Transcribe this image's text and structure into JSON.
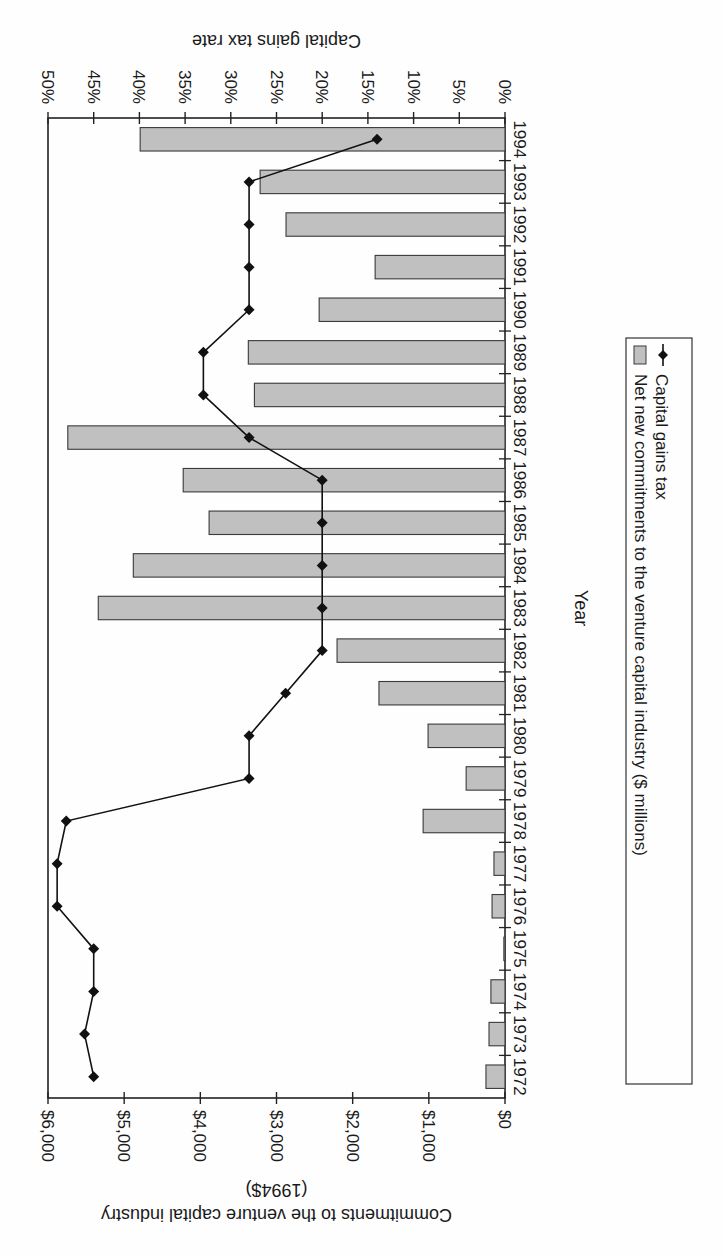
{
  "chart_data": {
    "type": "bar",
    "orientation": "horizontal",
    "rendered_rotation_deg": 180,
    "title": "",
    "categories": [
      "1972",
      "1973",
      "1974",
      "1975",
      "1976",
      "1977",
      "1978",
      "1979",
      "1980",
      "1981",
      "1982",
      "1983",
      "1984",
      "1985",
      "1986",
      "1987",
      "1988",
      "1989",
      "1990",
      "1991",
      "1992",
      "1993",
      "1994"
    ],
    "category_axis_label": "Year",
    "series": [
      {
        "name": "Net new commitments to the venture capital industry ($ millions)",
        "type": "bar",
        "axis": "primary",
        "color": "#c0c0c0",
        "values": [
          250,
          210,
          185,
          15,
          170,
          145,
          1075,
          510,
          1010,
          1655,
          2205,
          5340,
          4880,
          3885,
          4225,
          5740,
          3290,
          3370,
          2440,
          1705,
          2875,
          3215,
          4790
        ]
      },
      {
        "name": "Capital gains tax",
        "type": "line",
        "axis": "secondary",
        "color": "#111111",
        "marker": "diamond",
        "values": [
          45,
          46,
          45,
          45,
          49,
          49,
          48,
          28,
          28,
          24,
          20,
          20,
          20,
          20,
          20,
          28,
          33,
          33,
          28,
          28,
          28,
          28,
          14
        ]
      }
    ],
    "primary_axis": {
      "label_line1": "Commitments to the venture capital industry",
      "label_line2": "(1994$)",
      "range": [
        0,
        6000
      ],
      "ticks": [
        0,
        1000,
        2000,
        3000,
        4000,
        5000,
        6000
      ],
      "tick_labels": [
        "$0",
        "$1,000",
        "$2,000",
        "$3,000",
        "$4,000",
        "$5,000",
        "$6,000"
      ]
    },
    "secondary_axis": {
      "label": "Capital gains tax rate",
      "range": [
        0,
        50
      ],
      "ticks": [
        0,
        5,
        10,
        15,
        20,
        25,
        30,
        35,
        40,
        45,
        50
      ],
      "tick_labels": [
        "0%",
        "5%",
        "10%",
        "15%",
        "20%",
        "25%",
        "30%",
        "35%",
        "40%",
        "45%",
        "50%"
      ]
    },
    "grid": false,
    "legend": {
      "position": "side",
      "entries": [
        "Net new commitments to the venture capital industry ($ millions)",
        "Capital gains tax"
      ]
    }
  }
}
